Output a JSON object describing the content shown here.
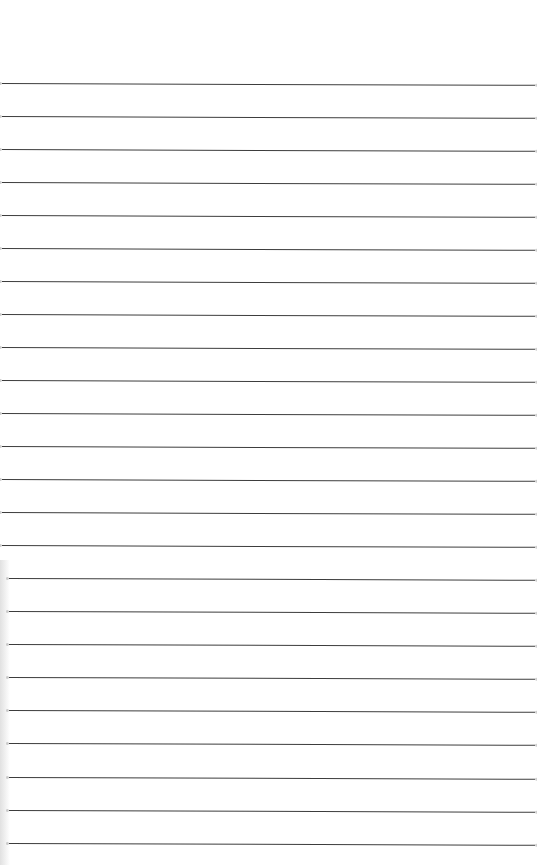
{
  "document": {
    "type": "lined-paper",
    "background_color": "#ffffff",
    "rule_color": "#3c3c3c",
    "rule_count": 24,
    "rule_spacing_px": 33,
    "rules": [
      {
        "y": 83
      },
      {
        "y": 116
      },
      {
        "y": 149
      },
      {
        "y": 182
      },
      {
        "y": 215
      },
      {
        "y": 248
      },
      {
        "y": 281
      },
      {
        "y": 314
      },
      {
        "y": 347
      },
      {
        "y": 380
      },
      {
        "y": 413
      },
      {
        "y": 446
      },
      {
        "y": 479
      },
      {
        "y": 512
      },
      {
        "y": 545
      },
      {
        "y": 578
      },
      {
        "y": 611
      },
      {
        "y": 644
      },
      {
        "y": 677
      },
      {
        "y": 710
      },
      {
        "y": 743
      },
      {
        "y": 777
      },
      {
        "y": 810
      },
      {
        "y": 843
      }
    ],
    "text_lines": []
  }
}
